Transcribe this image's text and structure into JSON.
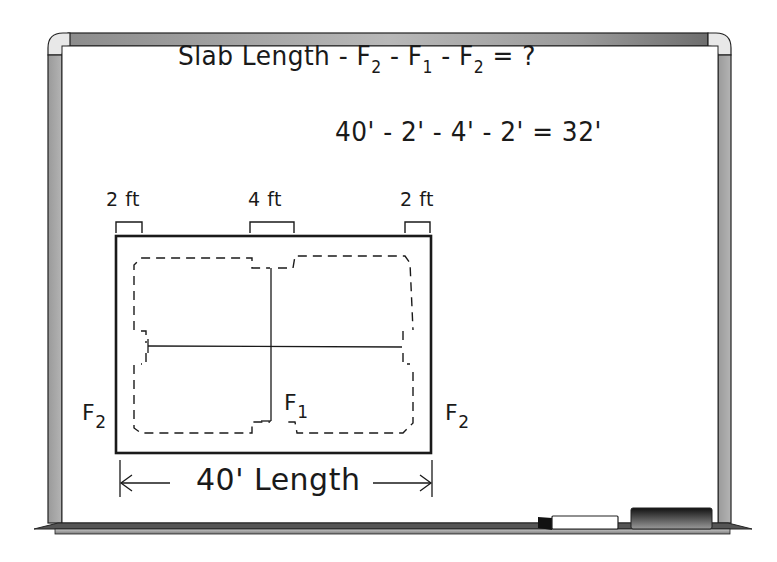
{
  "board": {
    "type": "whiteboard",
    "frame_color": "#9a9a9a",
    "surface_color": "#ffffff"
  },
  "formula": {
    "parts": [
      "Slab Length",
      " - F",
      "2",
      " - F",
      "1",
      " - F",
      "2",
      " = ?"
    ],
    "text": "Slab Length - F2 - F1 - F2 = ?"
  },
  "calculation": {
    "parts": [
      "40' - 2' - 4' - 2' = 32'"
    ],
    "text": "40' - 2' - 4' - 2' = 32'",
    "values": {
      "slab_length_ft": 40,
      "f2_ft": 2,
      "f1_ft": 4,
      "result_ft": 32
    }
  },
  "dimensions": {
    "left_footing": "2 ft",
    "center_footing": "4 ft",
    "right_footing": "2 ft",
    "overall_length": "40' Length"
  },
  "labels": {
    "f2_left": {
      "letter": "F",
      "sub": "2"
    },
    "f1": {
      "letter": "F",
      "sub": "1"
    },
    "f2_right": {
      "letter": "F",
      "sub": "2"
    }
  },
  "tray_items": [
    {
      "name": "marker"
    },
    {
      "name": "eraser"
    }
  ]
}
